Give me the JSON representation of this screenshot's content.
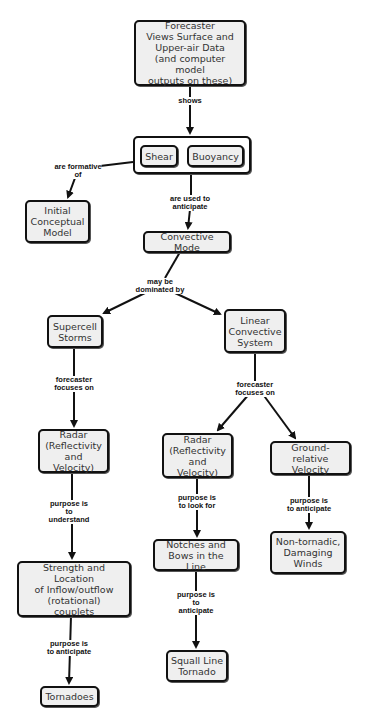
{
  "diagram": {
    "type": "concept-map",
    "colors": {
      "node_fill": "#efefef",
      "node_border": "#111111",
      "link": "#111111",
      "background": "#ffffff"
    },
    "nodes": {
      "forecaster": "Forecaster\nViews Surface and\nUpper-air Data\n(and computer model\noutputs on these)",
      "shear": "Shear",
      "buoyancy": "Buoyancy",
      "initial_model": "Initial\nConceptual\nModel",
      "convective_mode": "Convective Mode",
      "supercell": "Supercell\nStorms",
      "linear_system": "Linear\nConvective\nSystem",
      "radar_left": "Radar\n(Reflectivity\nand Velocity)",
      "radar_mid": "Radar\n(Reflectivity\nand Velocity)",
      "ground_velocity": "Ground-relative\nVelocity",
      "strength_location": "Strength and Location\nof Inflow/outflow\n(rotational)\ncouplets",
      "notches_bows": "Notches and\nBows in the Line",
      "non_tornadic": "Non-tornadic,\nDamaging\nWinds",
      "squall_tornado": "Squall Line\nTornado",
      "tornadoes": "Tornadoes"
    },
    "links": {
      "shows": "shows",
      "formative": "are formative\nof",
      "used_to_anticipate": "are used to\nanticipate",
      "dominated_by": "may be\ndominated by",
      "focuses_left": "forecaster\nfocuses on",
      "focuses_right": "forecaster\nfocuses on",
      "understand": "purpose is\nto\nunderstand",
      "look_for": "purpose is\nto look for",
      "anticipate_winds": "purpose is\nto anticipate",
      "anticipate_squall": "purpose is\nto\nanticipate",
      "anticipate_tornadoes": "purpose is\nto anticipate"
    },
    "edges": [
      {
        "from": "forecaster",
        "label": "shows",
        "to": "shear_buoyancy_group"
      },
      {
        "from": "shear_buoyancy_group",
        "label": "are formative of",
        "to": "initial_model"
      },
      {
        "from": "shear_buoyancy_group",
        "label": "are used to anticipate",
        "to": "convective_mode"
      },
      {
        "from": "convective_mode",
        "label": "may be dominated by",
        "to": [
          "supercell",
          "linear_system"
        ]
      },
      {
        "from": "supercell",
        "label": "forecaster focuses on",
        "to": "radar_left"
      },
      {
        "from": "linear_system",
        "label": "forecaster focuses on",
        "to": [
          "radar_mid",
          "ground_velocity"
        ]
      },
      {
        "from": "radar_left",
        "label": "purpose is to understand",
        "to": "strength_location"
      },
      {
        "from": "radar_mid",
        "label": "purpose is to look for",
        "to": "notches_bows"
      },
      {
        "from": "ground_velocity",
        "label": "purpose is to anticipate",
        "to": "non_tornadic"
      },
      {
        "from": "notches_bows",
        "label": "purpose is to anticipate",
        "to": "squall_tornado"
      },
      {
        "from": "strength_location",
        "label": "purpose is to anticipate",
        "to": "tornadoes"
      }
    ]
  }
}
